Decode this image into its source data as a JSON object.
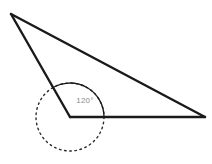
{
  "figure": {
    "background_color": "#ffffff",
    "width": 212,
    "height": 164
  },
  "diagram": {
    "type": "geometry",
    "shape": "triangle",
    "stroke_color": "#1a1a1a",
    "stroke_width": 2,
    "vertices": [
      {
        "name": "apex",
        "label": "",
        "x": 11,
        "y": 14
      },
      {
        "name": "angle-vertex",
        "label": "",
        "x": 70,
        "y": 117
      },
      {
        "name": "right-vertex",
        "label": "",
        "x": 205,
        "y": 117
      }
    ],
    "edges": [
      {
        "name": "left-edge",
        "from": "apex",
        "to": "angle-vertex"
      },
      {
        "name": "hypotenuse-edge",
        "from": "apex",
        "to": "right-vertex"
      },
      {
        "name": "base-edge",
        "from": "angle-vertex",
        "to": "right-vertex"
      }
    ]
  },
  "angle_marking": {
    "label": "120°",
    "value": 120,
    "unit": "degrees",
    "label_color": "#8a8a8a",
    "label_x": 85,
    "label_y": 103,
    "vertex_x": 70,
    "vertex_y": 117,
    "arc_radius": 34,
    "arc_start_angle": 0,
    "arc_end_angle": 120,
    "arc_color": "#1a1a1a",
    "arc_stroke_width": 1.3
  },
  "reference_circle": {
    "name": "dotted-circle",
    "center_x": 70,
    "center_y": 117,
    "radius": 34,
    "stroke_color": "#2b2b2b",
    "stroke_width": 1.4,
    "dash_pattern": "1.6 3.6"
  }
}
